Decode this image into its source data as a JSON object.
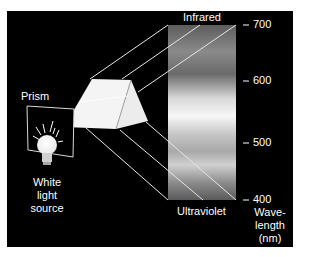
{
  "figure": {
    "prism_label": "Prism",
    "source_label_line1": "White",
    "source_label_line2": "light",
    "source_label_line3": "source",
    "top_label": "Infrared",
    "bottom_label": "Ultraviolet",
    "axis_title_line1": "Wave-",
    "axis_title_line2": "length",
    "axis_title_line3": "(nm)",
    "ticks": [
      {
        "value": "700"
      },
      {
        "value": "600"
      },
      {
        "value": "500"
      },
      {
        "value": "400"
      }
    ]
  },
  "colors": {
    "background": "#000000",
    "line": "#e8e8e8",
    "prism": "#f2f2f2",
    "spectrum_dark": "#5a5a5a",
    "spectrum_light": "#f5f5f5"
  }
}
